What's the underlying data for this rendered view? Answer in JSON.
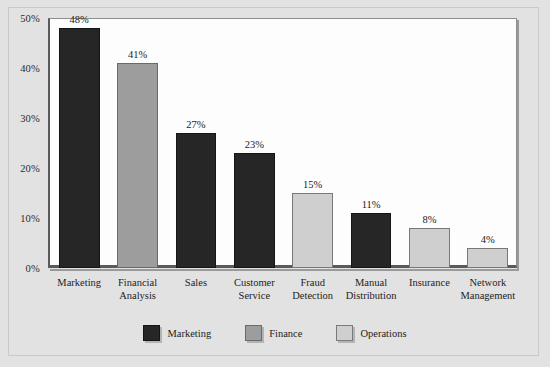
{
  "chart_data": {
    "type": "bar",
    "title": "",
    "subtitle": "",
    "xlabel": "",
    "ylabel": "",
    "ylim": [
      0,
      50
    ],
    "ytick_labels": [
      "0%",
      "10%",
      "20%",
      "30%",
      "40%",
      "50%"
    ],
    "ytick_values": [
      0,
      10,
      20,
      30,
      40,
      50
    ],
    "grid": false,
    "legend_position": "bottom-center",
    "categories": [
      "Marketing",
      "Financial Analysis",
      "Sales",
      "Customer Service",
      "Fraud Detection",
      "Manual Distribution",
      "Insurance",
      "Network Management"
    ],
    "category_label_lines": [
      [
        "Marketing"
      ],
      [
        "Financial",
        "Analysis"
      ],
      [
        "Sales"
      ],
      [
        "Customer",
        "Service"
      ],
      [
        "Fraud",
        "Detection"
      ],
      [
        "Manual",
        "Distribution"
      ],
      [
        "Insurance"
      ],
      [
        "Network",
        "Management"
      ]
    ],
    "values": [
      48,
      41,
      27,
      23,
      15,
      11,
      8,
      4
    ],
    "value_labels": [
      "48%",
      "41%",
      "27%",
      "23%",
      "15%",
      "11%",
      "8%",
      "4%"
    ],
    "point_series": [
      "Marketing",
      "Finance",
      "Marketing",
      "Marketing",
      "Operations",
      "Marketing",
      "Operations",
      "Operations"
    ],
    "series": [
      {
        "name": "Marketing",
        "color": "#262626"
      },
      {
        "name": "Finance",
        "color": "#9d9d9d"
      },
      {
        "name": "Operations",
        "color": "#cfcfcf"
      }
    ]
  },
  "legend": {
    "items": [
      {
        "label": "Marketing",
        "series_key": "marketing"
      },
      {
        "label": "Finance",
        "series_key": "finance"
      },
      {
        "label": "Operations",
        "series_key": "operations"
      }
    ]
  },
  "colors": {
    "background": "#e2e2e2",
    "plot_background": "#fdfdfd",
    "axis": "#5a5a5a",
    "marketing": "#262626",
    "finance": "#9d9d9d",
    "operations": "#cfcfcf"
  }
}
